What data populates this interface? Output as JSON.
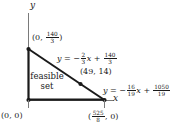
{
  "figure": {
    "type": "linear-programming-feasible-region",
    "axes": {
      "y_label": "y",
      "x_label": "x"
    },
    "region_label_line1": "feasible",
    "region_label_line2": "set",
    "vertices": [
      {
        "name": "origin",
        "label": "(0, 0)",
        "x": 0,
        "y": 0
      },
      {
        "name": "y-intercept",
        "label": "(0, 140/3)",
        "x": 0,
        "y": "140/3",
        "frac_num": "140",
        "frac_den": "3",
        "prefix": "(0, ",
        "suffix": ")"
      },
      {
        "name": "intersection",
        "label": "(49, 14)",
        "x": 49,
        "y": 14
      },
      {
        "name": "x-intercept",
        "label": "(525/8, 0)",
        "x": "525/8",
        "y": 0,
        "frac_num": "525",
        "frac_den": "8",
        "prefix": "(",
        "suffix": ", 0)"
      }
    ],
    "constraints": [
      {
        "name": "upper-line",
        "lhs": "y",
        "eq": "=",
        "sign": "−",
        "slope_num": "2",
        "slope_den": "3",
        "var": "x",
        "plus": "+",
        "intercept_num": "140",
        "intercept_den": "3",
        "equation": "y = -2/3 x + 140/3"
      },
      {
        "name": "lower-line",
        "lhs": "y",
        "eq": "=",
        "sign": "−",
        "slope_num": "16",
        "slope_den": "19",
        "var": "x",
        "plus": "+",
        "intercept_num": "1050",
        "intercept_den": "19",
        "equation": "y = -16/19 x + 1050/19"
      }
    ],
    "colors": {
      "ink": "#1a1a1a",
      "axis": "#6f6f6f",
      "background": "#ffffff"
    }
  }
}
